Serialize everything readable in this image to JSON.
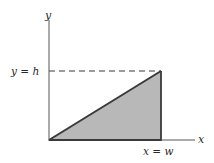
{
  "diagram": {
    "axes": {
      "x_label": "x",
      "y_label": "y"
    },
    "annotations": {
      "height_line": "y = h",
      "width_line": "x = w"
    },
    "shape": {
      "type": "right-triangle",
      "fill": "#b8b8b8",
      "stroke": "#3a3a3a",
      "vertices": [
        [
          "0",
          "0"
        ],
        [
          "w",
          "0"
        ],
        [
          "w",
          "h"
        ]
      ]
    }
  }
}
